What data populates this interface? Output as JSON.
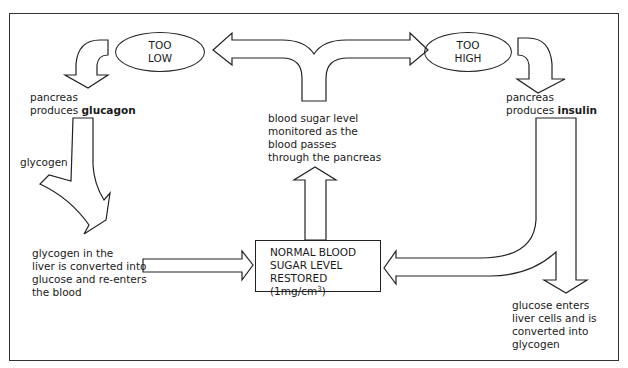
{
  "diagram": {
    "ovals": {
      "too_low": [
        "TOO",
        "LOW"
      ],
      "too_high": [
        "TOO",
        "HIGH"
      ]
    },
    "left": {
      "pancreas_line1": "pancreas",
      "pancreas_line2_prefix": "produces ",
      "hormone": "glucagon",
      "glycogen_label": "glycogen",
      "liver_text": [
        "glycogen in the",
        "liver is converted into",
        "glucose and re-enters",
        "the blood"
      ]
    },
    "center": {
      "monitor_text": [
        "blood sugar level",
        "monitored as the",
        "blood passes",
        "through the pancreas"
      ],
      "normal_box": {
        "line1": "NORMAL BLOOD",
        "line2": "SUGAR LEVEL",
        "line3_prefix": "RESTORED (1mg/cm",
        "line3_sup": "3",
        "line3_suffix": ")"
      }
    },
    "right": {
      "pancreas_line1": "pancreas",
      "pancreas_line2_prefix": "produces ",
      "hormone": "insulin",
      "glucose_text": [
        "glucose enters",
        "liver cells and is",
        "converted into",
        "glycogen"
      ]
    },
    "colors": {
      "stroke": "#222222",
      "fill": "#ffffff",
      "text": "#1a1a1a"
    }
  }
}
